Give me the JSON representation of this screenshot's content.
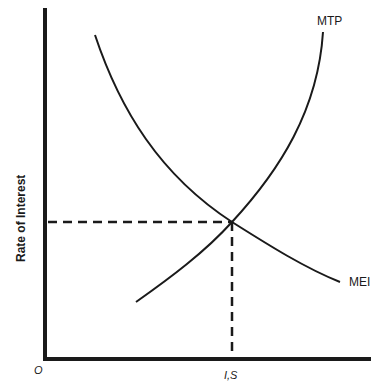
{
  "diagram": {
    "type": "economics-supply-demand",
    "ylabel": "Rate of Interest",
    "origin_label": "O",
    "x_tick_label": "I,S",
    "curves": [
      {
        "name": "MTP",
        "shape": "upward-sloping, convex"
      },
      {
        "name": "MEI",
        "shape": "downward-sloping, convex"
      }
    ],
    "equilibrium": {
      "description": "Intersection of MTP and MEI determines rate of interest and I,S"
    },
    "colors": {
      "line": "#1a1a1a",
      "background": "#ffffff"
    }
  }
}
